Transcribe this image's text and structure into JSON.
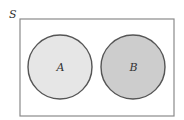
{
  "diagram": {
    "type": "venn",
    "title": "",
    "universe": {
      "label": "S",
      "x": 20,
      "y": 19,
      "width": 154,
      "height": 97,
      "stroke": "#8a8a8a",
      "fill": "#ffffff"
    },
    "sets": [
      {
        "label": "A",
        "cx": 60,
        "cy": 67,
        "r": 32,
        "fill": "#e6e6e6",
        "stroke": "#555555"
      },
      {
        "label": "B",
        "cx": 133,
        "cy": 67,
        "r": 32,
        "fill": "#cdcdcd",
        "stroke": "#555555"
      }
    ],
    "relationship": "disjoint"
  }
}
